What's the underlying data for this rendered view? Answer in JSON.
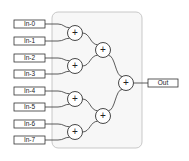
{
  "diagram": {
    "type": "adder-tree",
    "container": {
      "x": 52,
      "y": 12,
      "w": 90,
      "h": 136,
      "fill": "#f7f7f7",
      "stroke": "#bbbbbb"
    },
    "inputs": [
      {
        "label": "In-0",
        "y": 24
      },
      {
        "label": "In-1",
        "y": 41
      },
      {
        "label": "In-2",
        "y": 58
      },
      {
        "label": "In-3",
        "y": 74
      },
      {
        "label": "In-4",
        "y": 91
      },
      {
        "label": "In-5",
        "y": 107
      },
      {
        "label": "In-6",
        "y": 124
      },
      {
        "label": "In-7",
        "y": 140
      }
    ],
    "adders": [
      {
        "id": "a0",
        "x": 75,
        "y": 33,
        "symbol": "+"
      },
      {
        "id": "a1",
        "x": 75,
        "y": 66,
        "symbol": "+"
      },
      {
        "id": "a2",
        "x": 75,
        "y": 99,
        "symbol": "+"
      },
      {
        "id": "a3",
        "x": 75,
        "y": 132,
        "symbol": "+"
      },
      {
        "id": "b0",
        "x": 103,
        "y": 50,
        "symbol": "+"
      },
      {
        "id": "b1",
        "x": 103,
        "y": 116,
        "symbol": "+"
      },
      {
        "id": "c0",
        "x": 126,
        "y": 83,
        "symbol": "+"
      }
    ],
    "output": {
      "label": "Out",
      "y": 83
    },
    "colors": {
      "stroke": "#333333",
      "box_fill": "#ffffff",
      "text": "#222222"
    }
  }
}
